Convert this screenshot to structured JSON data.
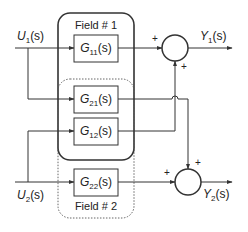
{
  "diagram": {
    "type": "block-diagram",
    "inputs": [
      {
        "id": "u1",
        "main": "U",
        "sub": "1",
        "arg": "(s)"
      },
      {
        "id": "u2",
        "main": "U",
        "sub": "2",
        "arg": "(s)"
      }
    ],
    "outputs": [
      {
        "id": "y1",
        "main": "Y",
        "sub": "1",
        "arg": "(s)"
      },
      {
        "id": "y2",
        "main": "Y",
        "sub": "2",
        "arg": "(s)"
      }
    ],
    "fields": [
      {
        "id": "field1",
        "label": "Field # 1",
        "border": "solid"
      },
      {
        "id": "field2",
        "label": "Field # 2",
        "border": "dotted"
      }
    ],
    "blocks": [
      {
        "id": "g11",
        "main": "G",
        "sub": "11",
        "arg": "(s)"
      },
      {
        "id": "g21",
        "main": "G",
        "sub": "21",
        "arg": "(s)"
      },
      {
        "id": "g12",
        "main": "G",
        "sub": "12",
        "arg": "(s)"
      },
      {
        "id": "g22",
        "main": "G",
        "sub": "22",
        "arg": "(s)"
      }
    ],
    "summing_junctions": [
      {
        "id": "sum1",
        "signs": [
          "+",
          "+"
        ]
      },
      {
        "id": "sum2",
        "signs": [
          "+",
          "+"
        ]
      }
    ]
  }
}
